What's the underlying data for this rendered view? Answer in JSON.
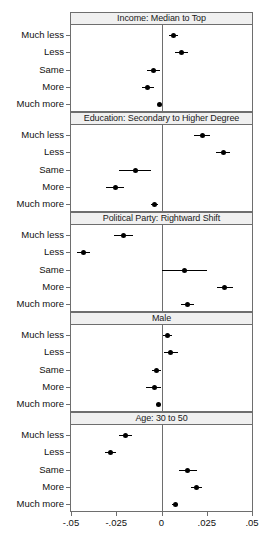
{
  "chart_data": {
    "type": "scatter",
    "title": "",
    "subtitle": "",
    "xlabel": "",
    "ylabel": "",
    "xlim": [
      -0.05,
      0.05
    ],
    "grid": false,
    "legend": null,
    "zero_reference_line": 0,
    "marker": "filled-circle",
    "error_bars": "horizontal confidence intervals",
    "xticks": [
      -0.05,
      -0.025,
      0,
      0.025,
      0.05
    ],
    "xticklabels": [
      "-.05",
      "-.025",
      "0",
      ".025",
      ".05"
    ],
    "categories": [
      "Much less",
      "Less",
      "Same",
      "More",
      "Much more"
    ],
    "panels": [
      {
        "label": "Income: Median to Top",
        "values": [
          0.0065,
          0.011,
          -0.0045,
          -0.0075,
          -0.001
        ],
        "ci_low": [
          0.004,
          0.0075,
          -0.008,
          -0.011,
          -0.002
        ],
        "ci_high": [
          0.009,
          0.0145,
          -0.001,
          -0.004,
          0.0
        ]
      },
      {
        "label": "Education: Secondary to Higher Degree",
        "values": [
          0.0225,
          0.034,
          -0.0145,
          -0.0255,
          -0.004
        ],
        "ci_low": [
          0.018,
          0.03,
          -0.0235,
          -0.0305,
          -0.006
        ],
        "ci_high": [
          0.027,
          0.038,
          -0.006,
          -0.0205,
          -0.002
        ]
      },
      {
        "label": "Political Party: Rightward Shift",
        "values": [
          -0.021,
          -0.043,
          0.0125,
          0.035,
          0.0145
        ],
        "ci_low": [
          -0.0265,
          -0.0465,
          0.0,
          0.0305,
          0.011
        ],
        "ci_high": [
          -0.0155,
          -0.0395,
          0.025,
          0.0395,
          0.018
        ]
      },
      {
        "label": "Male",
        "values": [
          0.0035,
          0.005,
          -0.003,
          -0.004,
          -0.0015
        ],
        "ci_low": [
          0.001,
          0.0015,
          -0.0055,
          -0.0085,
          -0.003
        ],
        "ci_high": [
          0.006,
          0.009,
          -0.0005,
          0.0,
          0.0
        ]
      },
      {
        "label": "Age: 30 to 50",
        "values": [
          -0.02,
          -0.028,
          0.0145,
          0.0195,
          0.0075
        ],
        "ci_low": [
          -0.0235,
          -0.031,
          0.0095,
          0.0165,
          0.006
        ],
        "ci_high": [
          -0.0165,
          -0.025,
          0.0195,
          0.0225,
          0.009
        ]
      }
    ]
  }
}
